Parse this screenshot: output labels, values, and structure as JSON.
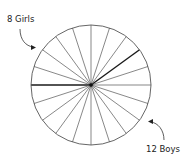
{
  "diagram": {
    "type": "fraction-circle",
    "sectors_total": 20,
    "labels": {
      "girls": "8 Girls",
      "boys": "12 Boys"
    },
    "groups": [
      {
        "name": "Girls",
        "count": 8
      },
      {
        "name": "Boys",
        "count": 12
      }
    ],
    "colors": {
      "stroke": "#555555",
      "bold_stroke": "#1a1a1a",
      "text": "#222222"
    }
  }
}
